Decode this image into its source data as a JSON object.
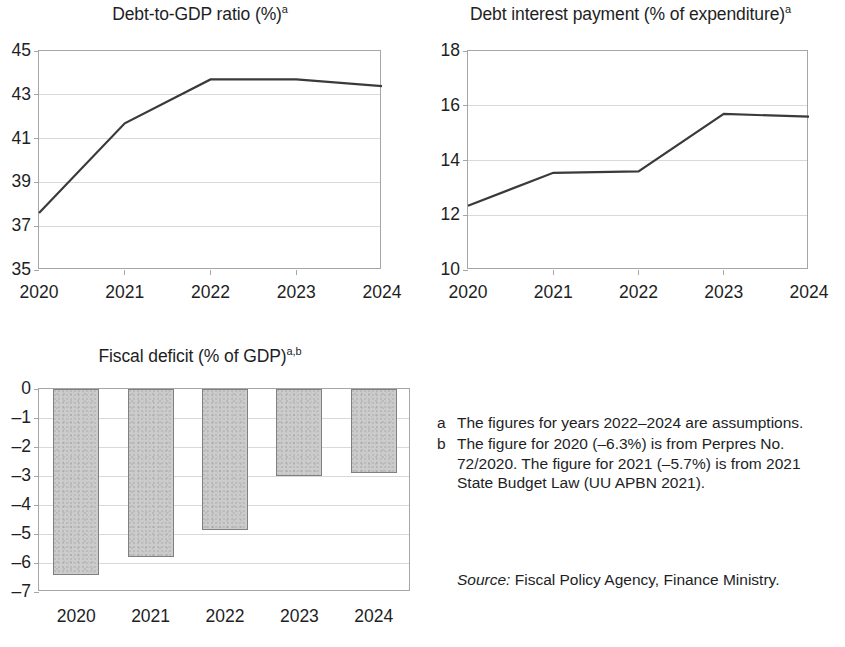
{
  "figure": {
    "source_prefix": "Source:",
    "source_text": " Fiscal Policy Agency, Finance Ministry."
  },
  "notes": [
    {
      "marker": "a",
      "text": "The figures for years 2022–2024 are assumptions."
    },
    {
      "marker": "b",
      "text": "The figure for 2020 (–6.3%) is from Perpres No. 72/2020. The figure for 2021 (–5.7%) is from 2021 State Budget Law (UU APBN 2021)."
    }
  ],
  "chart_data": [
    {
      "id": "debt_to_gdp",
      "type": "line",
      "title": "Debt-to-GDP ratio (%)",
      "title_sup": "a",
      "xlabel": "",
      "ylabel": "",
      "categories": [
        "2020",
        "2021",
        "2022",
        "2023",
        "2024"
      ],
      "values": [
        37.6,
        41.7,
        43.7,
        43.7,
        43.4
      ],
      "ylim": [
        35,
        45
      ],
      "yticks": [
        45,
        43,
        41,
        39,
        37,
        35
      ],
      "grid": true,
      "legend": "none",
      "series_color": "#3a3a3a"
    },
    {
      "id": "debt_interest_payment",
      "type": "line",
      "title": "Debt interest payment (% of expenditure)",
      "title_sup": "a",
      "xlabel": "",
      "ylabel": "",
      "categories": [
        "2020",
        "2021",
        "2022",
        "2023",
        "2024"
      ],
      "values": [
        12.35,
        13.55,
        13.6,
        15.7,
        15.6
      ],
      "ylim": [
        10,
        18
      ],
      "yticks": [
        18,
        16,
        14,
        12,
        10
      ],
      "grid": true,
      "legend": "none",
      "series_color": "#3a3a3a"
    },
    {
      "id": "fiscal_deficit",
      "type": "bar",
      "title": "Fiscal deficit (% of GDP)",
      "title_sup": "a,b",
      "xlabel": "",
      "ylabel": "",
      "categories": [
        "2020",
        "2021",
        "2022",
        "2023",
        "2024"
      ],
      "values": [
        -6.4,
        -5.8,
        -4.85,
        -3.0,
        -2.9
      ],
      "ylim": [
        -7,
        0
      ],
      "yticks": [
        0,
        -1,
        -2,
        -3,
        -4,
        -5,
        -6,
        -7
      ],
      "ytick_labels": [
        "0",
        "–1",
        "–2",
        "–3",
        "–4",
        "–5",
        "–6",
        "–7"
      ],
      "grid": true,
      "legend": "none",
      "bar_fill": "#cccccc",
      "bar_stroke": "#808080"
    }
  ]
}
